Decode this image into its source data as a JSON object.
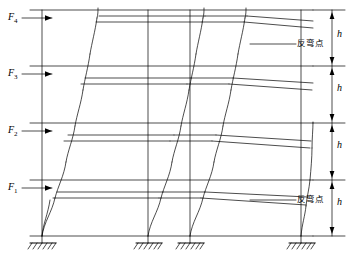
{
  "diagram": {
    "title": "",
    "type": "multi-storey frame lateral deflection diagram",
    "force_labels": [
      {
        "id": "F1",
        "text": "F",
        "sub": "1",
        "x": 8,
        "y": 179
      },
      {
        "id": "F2",
        "text": "F",
        "sub": "2",
        "x": 8,
        "y": 123
      },
      {
        "id": "F3",
        "text": "F",
        "sub": "3",
        "x": 8,
        "y": 66
      },
      {
        "id": "F4",
        "text": "F",
        "sub": "4",
        "x": 8,
        "y": 12
      }
    ],
    "height_labels": [
      {
        "id": "h1",
        "text": "h",
        "x": 327,
        "y": 188
      },
      {
        "id": "h2",
        "text": "h",
        "x": 327,
        "y": 133
      },
      {
        "id": "h3",
        "text": "h",
        "x": 327,
        "y": 78
      },
      {
        "id": "h4",
        "text": "h",
        "x": 327,
        "y": 25
      }
    ],
    "annotations": [
      {
        "id": "inflection-point-top",
        "text": "反弯点",
        "x": 298,
        "y": 40
      },
      {
        "id": "inflection-point-bottom",
        "text": "反弯点",
        "x": 298,
        "y": 196
      }
    ],
    "colors": {
      "line": "#000000",
      "background": "#ffffff"
    }
  }
}
